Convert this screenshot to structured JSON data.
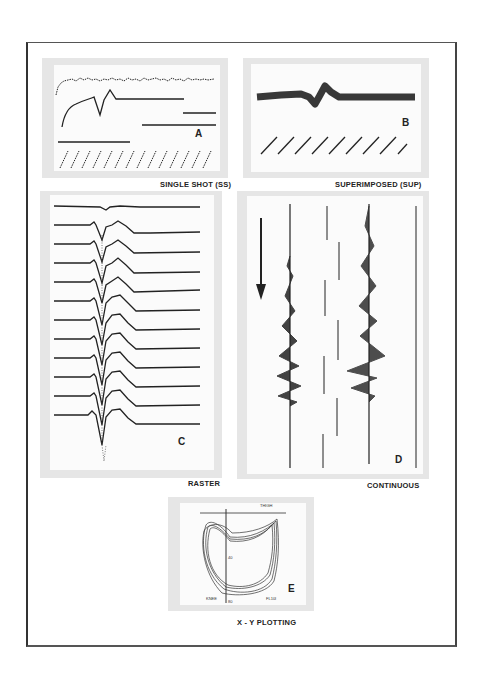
{
  "figure": {
    "panels": [
      {
        "id": "A",
        "letter": "A",
        "caption": "SINGLE SHOT (SS)"
      },
      {
        "id": "B",
        "letter": "B",
        "caption": "SUPERIMPOSED (SUP)"
      },
      {
        "id": "C",
        "letter": "C",
        "caption": "RASTER"
      },
      {
        "id": "D",
        "letter": "D",
        "caption": "CONTINUOUS"
      },
      {
        "id": "E",
        "letter": "E",
        "caption": "X - Y PLOTTING",
        "plot_labels": {
          "top_axis": "THIGH",
          "bottom_left": "KNEE",
          "bottom_right": "FL10I",
          "center_mark": "40",
          "bottom_mark": "80"
        }
      }
    ]
  },
  "colors": {
    "ink": "#222222",
    "panel_bg": "#e6e6e6",
    "panel_inner": "#fbfbfb",
    "frame": "#444444"
  }
}
